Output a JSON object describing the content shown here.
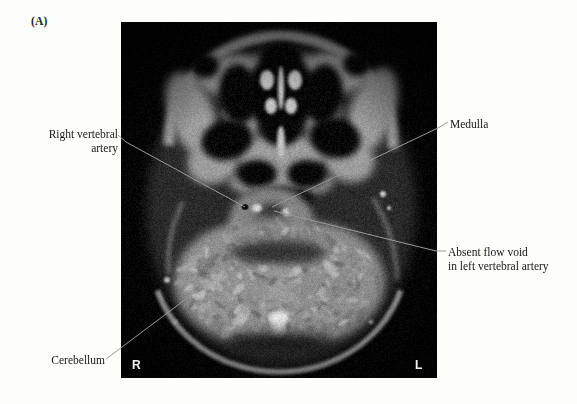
{
  "figure": {
    "panel_letter": "(A)",
    "modality": "axial MRI of skull base / posterior fossa"
  },
  "image": {
    "orientation_markers": {
      "right": "R",
      "left": "L"
    },
    "background_color": "#050505",
    "tissue_color": "#b9b9b9"
  },
  "annotations": [
    {
      "id": "right-vertebral-artery",
      "lines": [
        "Right vertebral",
        "artery"
      ],
      "text": "Right vertebral\nartery",
      "side": "left"
    },
    {
      "id": "cerebellum",
      "lines": [
        "Cerebellum"
      ],
      "text": "Cerebellum",
      "side": "left"
    },
    {
      "id": "medulla",
      "lines": [
        "Medulla"
      ],
      "text": "Medulla",
      "side": "right"
    },
    {
      "id": "absent-flow-void",
      "lines": [
        "Absent flow void",
        "in left vertebral artery"
      ],
      "text": "Absent flow void\nin left vertebral artery",
      "side": "right"
    }
  ],
  "leader_line_color": "#9a9a9a"
}
